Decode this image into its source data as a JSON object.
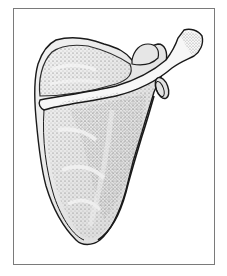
{
  "figure": {
    "view": "posterior",
    "style": "stippled pen-and-ink anatomical illustration",
    "colors": {
      "background": "#ffffff",
      "frame_border": "#7a7a7a",
      "outline": "#1a1a1a",
      "bone_light": "#eeeeee",
      "bone_mid": "#d6d6d6",
      "stipple": "#555555"
    },
    "parts": [
      "supraspinous fossa",
      "spine of scapula",
      "acromion",
      "glenoid cavity",
      "infraspinous fossa",
      "inferior angle",
      "coracoid process"
    ]
  }
}
